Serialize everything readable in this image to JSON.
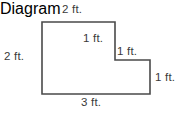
{
  "figure": {
    "shape_name": "L-shaped staircase polygon",
    "stroke_color": "#4a4a4a",
    "fill_color": "#ffffff",
    "text_color": "#3a3a3a",
    "stroke_width": 1.6,
    "labels": {
      "top": "2 ft.",
      "left": "2 ft.",
      "step_vertical": "1 ft.",
      "step_horizontal": "1 ft.",
      "right": "1 ft.",
      "bottom": "3 ft."
    }
  },
  "chart_data": {
    "type": "diagram",
    "title": "",
    "subtype": "geometry-dimension-figure",
    "shape": "L-shaped (staircase) hexagon",
    "units": "ft.",
    "vertices": [
      [
        42,
        22
      ],
      [
        115,
        22
      ],
      [
        115,
        60
      ],
      [
        150,
        60
      ],
      [
        150,
        94
      ],
      [
        42,
        94
      ]
    ],
    "edges": [
      {
        "name": "top",
        "from": [
          42,
          22
        ],
        "to": [
          115,
          22
        ],
        "orientation": "horizontal",
        "label": "2 ft.",
        "length": 2
      },
      {
        "name": "step-vertical",
        "from": [
          115,
          22
        ],
        "to": [
          115,
          60
        ],
        "orientation": "vertical",
        "label": "1 ft.",
        "length": 1
      },
      {
        "name": "step-horizontal",
        "from": [
          115,
          60
        ],
        "to": [
          150,
          60
        ],
        "orientation": "horizontal",
        "label": "1 ft.",
        "length": 1
      },
      {
        "name": "right",
        "from": [
          150,
          60
        ],
        "to": [
          150,
          94
        ],
        "orientation": "vertical",
        "label": "1 ft.",
        "length": 1
      },
      {
        "name": "bottom",
        "from": [
          150,
          94
        ],
        "to": [
          42,
          94
        ],
        "orientation": "horizontal",
        "label": "3 ft.",
        "length": 3
      },
      {
        "name": "left",
        "from": [
          42,
          94
        ],
        "to": [
          42,
          22
        ],
        "orientation": "vertical",
        "label": "2 ft.",
        "length": 2
      }
    ],
    "xlabel": "",
    "ylabel": "",
    "grid": false,
    "legend": false
  }
}
